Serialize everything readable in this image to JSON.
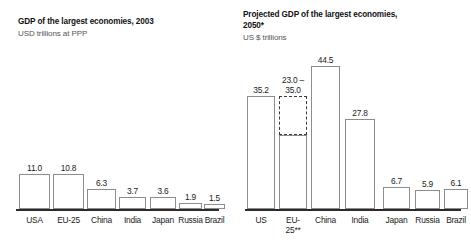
{
  "charts": {
    "left": {
      "title": "GDP of the largest economies, 2003",
      "subtitle": "USD trillions at PPP"
    },
    "right": {
      "title": "Projected GDP of the largest economies, 2050*",
      "subtitle": "US $ trillions"
    }
  },
  "chart_data": [
    {
      "type": "bar",
      "title": "GDP of the largest economies, 2003",
      "subtitle": "USD trillions at PPP",
      "xlabel": "",
      "ylabel": "USD trillions at PPP",
      "ylim": [
        0,
        45
      ],
      "grid": false,
      "legend": "none",
      "categories": [
        "USA",
        "EU-25",
        "China",
        "India",
        "Japan",
        "Russia",
        "Brazil"
      ],
      "values": [
        11.0,
        10.8,
        6.3,
        3.7,
        3.6,
        1.9,
        1.5
      ],
      "value_labels": [
        "11.0",
        "10.8",
        "6.3",
        "3.7",
        "3.6",
        "1.9",
        "1.5"
      ]
    },
    {
      "type": "bar",
      "title": "Projected GDP of the largest economies, 2050*",
      "subtitle": "US $ trillions",
      "xlabel": "",
      "ylabel": "US $ trillions",
      "ylim": [
        0,
        45
      ],
      "grid": false,
      "legend": "none",
      "categories": [
        "US",
        "EU-25**",
        "China",
        "India",
        "Japan",
        "Russia",
        "Brazil"
      ],
      "category_lines": [
        [
          "US"
        ],
        [
          "EU-",
          "25**"
        ],
        [
          "China"
        ],
        [
          "India"
        ],
        [
          "Japan"
        ],
        [
          "Russia"
        ],
        [
          "Brazil"
        ]
      ],
      "values": [
        35.2,
        23.0,
        44.5,
        27.8,
        6.7,
        5.9,
        6.1
      ],
      "value_labels": [
        "35.2",
        "23.0 –\n35.0",
        "44.5",
        "27.8",
        "6.7",
        "5.9",
        "6.1"
      ],
      "range_bars": [
        {
          "category": "EU-25**",
          "low": 23.0,
          "high": 35.0,
          "style": "dashed",
          "label": "23.0 – 35.0"
        }
      ],
      "annotations": [
        "* projected",
        "** EU-25"
      ]
    }
  ],
  "left_bars": [
    {
      "label": "USA",
      "value": "11.0"
    },
    {
      "label": "EU-25",
      "value": "10.8"
    },
    {
      "label": "China",
      "value": "6.3"
    },
    {
      "label": "India",
      "value": "3.7"
    },
    {
      "label": "Japan",
      "value": "3.6"
    },
    {
      "label": "Russia",
      "value": "1.9"
    },
    {
      "label": "Brazil",
      "value": "1.5"
    }
  ],
  "right_bars": [
    {
      "label_line1": "US",
      "label_line2": "",
      "value": "35.2"
    },
    {
      "label_line1": "EU-",
      "label_line2": "25**",
      "value_line1": "23.0 –",
      "value_line2": "35.0"
    },
    {
      "label_line1": "China",
      "label_line2": "",
      "value": "44.5"
    },
    {
      "label_line1": "India",
      "label_line2": "",
      "value": "27.8"
    },
    {
      "label_line1": "Japan",
      "label_line2": "",
      "value": "6.7"
    },
    {
      "label_line1": "Russia",
      "label_line2": "",
      "value": "5.9"
    },
    {
      "label_line1": "Brazil",
      "label_line2": "",
      "value": "6.1"
    }
  ],
  "colors": {
    "bar_outline": "#8d8d8d",
    "range_outline": "#3a3a3a",
    "axis": "#2b2b2b",
    "title": "#111111",
    "subtitle": "#555555"
  }
}
